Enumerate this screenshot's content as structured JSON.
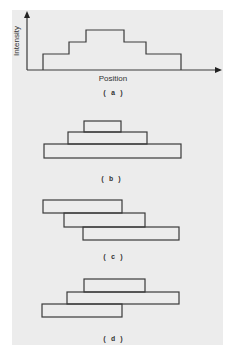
{
  "figure": {
    "background_color": "#ececec",
    "line_color": "#3a3a3a",
    "panel_a": {
      "caption": "( a )",
      "y_axis_label": "Intensity",
      "x_axis_label": "Position",
      "profile_description": "symmetric stepped intensity profile: three levels rising then falling"
    },
    "panel_b": {
      "caption": "( b )",
      "description": "three stacked rectangles centered, decreasing width upward (pyramid)"
    },
    "panel_c": {
      "caption": "( c )",
      "description": "three rectangles staggered diagonally, each shifted right and down"
    },
    "panel_d": {
      "caption": "( d )",
      "description": "three rectangles: bottom-left, wide middle, top offset right"
    }
  }
}
